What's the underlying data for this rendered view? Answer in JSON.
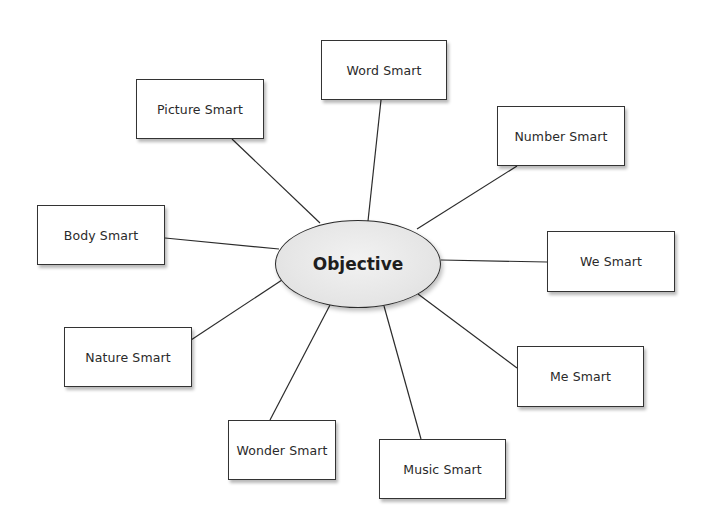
{
  "diagram": {
    "type": "mind-map",
    "center": {
      "label": "Objective",
      "cx": 358,
      "cy": 264,
      "rx": 83,
      "ry": 44
    },
    "nodes": [
      {
        "id": "word",
        "label": "Word Smart",
        "x": 321,
        "y": 40,
        "w": 126,
        "h": 60,
        "anchor": [
          381,
          100
        ],
        "target": [
          368,
          221
        ]
      },
      {
        "id": "picture",
        "label": "Picture Smart",
        "x": 136,
        "y": 79,
        "w": 128,
        "h": 60,
        "anchor": [
          232,
          139
        ],
        "target": [
          320,
          223
        ]
      },
      {
        "id": "number",
        "label": "Number Smart",
        "x": 497,
        "y": 106,
        "w": 128,
        "h": 60,
        "anchor": [
          517,
          166
        ],
        "target": [
          417,
          229
        ]
      },
      {
        "id": "body",
        "label": "Body Smart",
        "x": 37,
        "y": 205,
        "w": 128,
        "h": 60,
        "anchor": [
          165,
          238
        ],
        "target": [
          279,
          249
        ]
      },
      {
        "id": "we",
        "label": "We Smart",
        "x": 547,
        "y": 231,
        "w": 128,
        "h": 61,
        "anchor": [
          547,
          262
        ],
        "target": [
          441,
          260
        ]
      },
      {
        "id": "nature",
        "label": "Nature Smart",
        "x": 64,
        "y": 327,
        "w": 128,
        "h": 60,
        "anchor": [
          191,
          340
        ],
        "target": [
          282,
          280
        ]
      },
      {
        "id": "me",
        "label": "Me Smart",
        "x": 517,
        "y": 346,
        "w": 127,
        "h": 61,
        "anchor": [
          517,
          368
        ],
        "target": [
          418,
          294
        ]
      },
      {
        "id": "wonder",
        "label": "Wonder Smart",
        "x": 228,
        "y": 420,
        "w": 108,
        "h": 60,
        "anchor": [
          270,
          420
        ],
        "target": [
          330,
          305
        ]
      },
      {
        "id": "music",
        "label": "Music Smart",
        "x": 379,
        "y": 439,
        "w": 127,
        "h": 60,
        "anchor": [
          421,
          439
        ],
        "target": [
          384,
          306
        ]
      }
    ]
  },
  "colors": {
    "stroke": "#2b2b2b",
    "box_fill": "#ffffff",
    "ellipse_fill": "#e6e6e6"
  }
}
